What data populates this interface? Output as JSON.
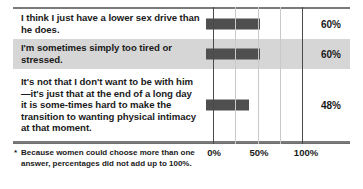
{
  "chart_data": {
    "type": "bar",
    "orientation": "horizontal",
    "title": "",
    "xlabel": "",
    "ylabel": "",
    "xlim": [
      0,
      125
    ],
    "grid": true,
    "grid_axis": "x",
    "legend": "none",
    "categories": [
      "I think I just have a lower sex drive than he does.",
      "I'm sometimes simply too tired or stressed.",
      "It's not that I don't want to be with him—it's just that at the end of a long day it is some-times hard to make the transition to wanting physical intimacy at that moment."
    ],
    "values": [
      60,
      60,
      48
    ],
    "value_labels": [
      "60%",
      "60%",
      "48%"
    ],
    "xticks": [
      0,
      25,
      50,
      75,
      100
    ],
    "xticklabels": [
      "0%",
      "",
      "50%",
      "",
      "100%"
    ],
    "bar_color": "#4f4f4f",
    "highlight_row_index": 1,
    "highlight_color": "#d6d6d6"
  },
  "rows": [
    {
      "label": "I think I just have a lower sex drive than he does.",
      "value": 60,
      "value_label": "60%",
      "highlighted": false
    },
    {
      "label": "I'm sometimes simply too tired or stressed.",
      "value": 60,
      "value_label": "60%",
      "highlighted": true
    },
    {
      "label": "It's not that I don't want to be with him—it's just that at the end of a long day it is some-times hard to make the transition to wanting physical intimacy at that moment.",
      "value": 48,
      "value_label": "48%",
      "highlighted": false
    }
  ],
  "axis": {
    "ticklabels": [
      {
        "text": "0%",
        "value": 0
      },
      {
        "text": "50%",
        "value": 50
      },
      {
        "text": "100%",
        "value": 100
      }
    ]
  },
  "footnote": {
    "marker": "*",
    "text": "Because women could choose more than one answer, percentages did not add up to 100%."
  }
}
